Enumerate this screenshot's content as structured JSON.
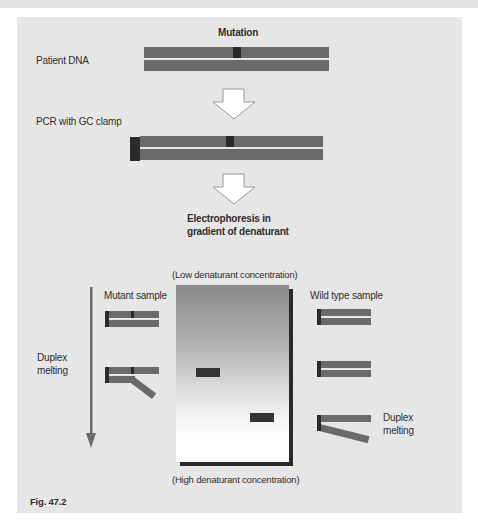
{
  "figure": {
    "caption": "Fig. 47.2",
    "stages": {
      "mutation_label": "Mutation",
      "patient_dna_label": "Patient DNA",
      "pcr_label": "PCR with GC clamp",
      "electrophoresis_label_line1": "Electrophoresis in",
      "electrophoresis_label_line2": "gradient of denaturant"
    },
    "gel": {
      "top_label": "(Low denaturant concentration)",
      "bottom_label": "(High denaturant concentration)",
      "bands": [
        {
          "lane": "mutant",
          "position": "middle"
        },
        {
          "lane": "wild_type",
          "position": "lower"
        }
      ]
    },
    "mutant_side": {
      "title": "Mutant sample",
      "melting_label_line1": "Duplex",
      "melting_label_line2": "melting"
    },
    "wild_type_side": {
      "title": "Wild type sample",
      "melting_label_line1": "Duplex",
      "melting_label_line2": "melting"
    },
    "colors": {
      "panel_background": "#e6e6e6",
      "strand": "#6a6a6a",
      "mutation_mark": "#2a2a2a",
      "gc_clamp": "#2a2a2a"
    }
  }
}
